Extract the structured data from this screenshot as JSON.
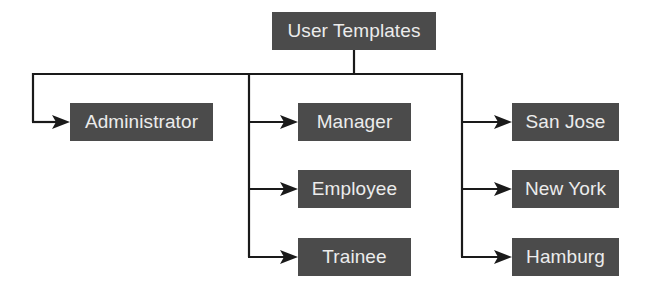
{
  "diagram": {
    "type": "hierarchy",
    "root": {
      "label": "User Templates"
    },
    "branches": [
      {
        "label": "Administrator"
      },
      {
        "group": "roles",
        "items": [
          {
            "label": "Manager"
          },
          {
            "label": "Employee"
          },
          {
            "label": "Trainee"
          }
        ]
      },
      {
        "group": "locations",
        "items": [
          {
            "label": "San Jose"
          },
          {
            "label": "New York"
          },
          {
            "label": "Hamburg"
          }
        ]
      }
    ],
    "colors": {
      "node_fill": "#4b4b4b",
      "node_text": "#ececec",
      "connector": "#1a1a1a",
      "background": "#ffffff"
    }
  }
}
